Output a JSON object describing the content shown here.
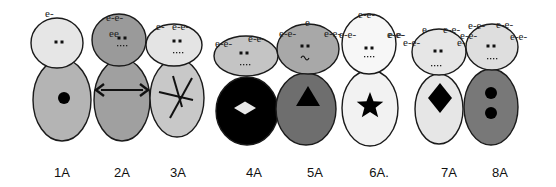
{
  "figures": [
    {
      "label": "1A",
      "label_x": 62,
      "head": {
        "cx": 57,
        "cy": 43,
        "rx": 26,
        "ry": 25,
        "fill": "#e6e6e6"
      },
      "body": {
        "cx": 62,
        "cy": 100,
        "rx": 29,
        "ry": 41,
        "fill": "#b4b4b4"
      },
      "eyes": [
        {
          "x": 56,
          "y": 42
        },
        {
          "x": 62,
          "y": 42
        }
      ],
      "mouth": "",
      "electrons": [
        {
          "text": "e-",
          "x": 45,
          "y": 17
        }
      ],
      "symbol": {
        "type": "dot",
        "cx": 64,
        "cy": 98,
        "r": 6,
        "fill": "#000000"
      }
    },
    {
      "label": "2A",
      "label_x": 122,
      "head": {
        "cx": 119,
        "cy": 40,
        "rx": 27,
        "ry": 26,
        "fill": "#9a9a9a"
      },
      "body": {
        "cx": 122,
        "cy": 100,
        "rx": 28,
        "ry": 41,
        "fill": "#a0a0a0"
      },
      "eyes": [
        {
          "x": 119,
          "y": 38
        },
        {
          "x": 125,
          "y": 38
        }
      ],
      "mouth": "dots",
      "mouth_pos": {
        "x": 117,
        "y": 45
      },
      "electrons": [
        {
          "text": "e-e-",
          "x": 106,
          "y": 21
        },
        {
          "text": "ee",
          "x": 109,
          "y": 37
        }
      ],
      "symbol": {
        "type": "double-arrow",
        "x1": 96,
        "x2": 148,
        "y": 90
      }
    },
    {
      "label": "3A",
      "label_x": 178,
      "head": {
        "cx": 174,
        "cy": 45,
        "rx": 28,
        "ry": 21,
        "fill": "#e4e4e4"
      },
      "body": {
        "cx": 177,
        "cy": 98,
        "rx": 27,
        "ry": 39,
        "fill": "#c8c8c8"
      },
      "eyes": [
        {
          "x": 174,
          "y": 41
        },
        {
          "x": 180,
          "y": 41
        }
      ],
      "mouth": "dots",
      "mouth_pos": {
        "x": 173,
        "y": 52
      },
      "electrons": [
        {
          "text": "e-",
          "x": 156,
          "y": 30
        },
        {
          "text": "e-e-",
          "x": 172,
          "y": 30
        }
      ],
      "symbol": {
        "type": "asterisk",
        "cx": 180,
        "cy": 97
      }
    },
    {
      "label": "4A",
      "label_x": 254,
      "head": {
        "cx": 246,
        "cy": 56,
        "rx": 32,
        "ry": 20,
        "fill": "#c4c4c4"
      },
      "body": {
        "cx": 247,
        "cy": 111,
        "rx": 31,
        "ry": 34,
        "fill": "#000000"
      },
      "eyes": [
        {
          "x": 241,
          "y": 53
        },
        {
          "x": 247,
          "y": 53
        }
      ],
      "mouth": "dots",
      "mouth_pos": {
        "x": 240,
        "y": 64
      },
      "electrons": [
        {
          "text": "e-e-",
          "x": 215,
          "y": 47
        },
        {
          "text": "e-e-",
          "x": 248,
          "y": 42
        }
      ],
      "symbol": {
        "type": "diamond",
        "cx": 245,
        "cy": 108,
        "w": 22,
        "h": 13,
        "fill": "#e8e8e8"
      }
    },
    {
      "label": "5A",
      "label_x": 315,
      "head": {
        "cx": 308,
        "cy": 49,
        "rx": 31,
        "ry": 25,
        "fill": "#a8a8a8"
      },
      "body": {
        "cx": 306,
        "cy": 109,
        "rx": 30,
        "ry": 36,
        "fill": "#6e6e6e"
      },
      "eyes": [
        {
          "x": 302,
          "y": 46
        },
        {
          "x": 308,
          "y": 46
        }
      ],
      "mouth": "tilde",
      "mouth_pos": {
        "x": 305,
        "y": 57
      },
      "electrons": [
        {
          "text": "e",
          "x": 305,
          "y": 26
        },
        {
          "text": "e-e-",
          "x": 279,
          "y": 37
        },
        {
          "text": "e-e-",
          "x": 324,
          "y": 37
        }
      ],
      "symbol": {
        "type": "triangle",
        "cx": 308,
        "cy": 96,
        "w": 24,
        "h": 20,
        "fill": "#000000"
      }
    },
    {
      "label": "6A.",
      "label_x": 379,
      "head": {
        "cx": 369,
        "cy": 44,
        "rx": 27,
        "ry": 30,
        "fill": "#f7f7f7"
      },
      "body": {
        "cx": 370,
        "cy": 108,
        "rx": 28,
        "ry": 38,
        "fill": "#f2f2f2"
      },
      "eyes": [
        {
          "x": 366,
          "y": 48
        },
        {
          "x": 372,
          "y": 48
        }
      ],
      "mouth": "dots",
      "mouth_pos": {
        "x": 364,
        "y": 56
      },
      "electrons": [
        {
          "text": "e-e-",
          "x": 358,
          "y": 18
        },
        {
          "text": "e-e-",
          "x": 339,
          "y": 38
        },
        {
          "text": "e-e-",
          "x": 387,
          "y": 38
        }
      ],
      "symbol": {
        "type": "star",
        "cx": 370,
        "cy": 106,
        "r": 14,
        "fill": "#000000"
      }
    },
    {
      "label": "7A",
      "label_x": 449,
      "head": {
        "cx": 439,
        "cy": 52,
        "rx": 27,
        "ry": 23,
        "fill": "#e6e6e6"
      },
      "body": {
        "cx": 439,
        "cy": 109,
        "rx": 24,
        "ry": 35,
        "fill": "#e6e6e6"
      },
      "eyes": [
        {
          "x": 435,
          "y": 51
        },
        {
          "x": 441,
          "y": 51
        }
      ],
      "mouth": "dots",
      "mouth_pos": {
        "x": 431,
        "y": 65
      },
      "electrons": [
        {
          "text": "e-e-",
          "x": 403,
          "y": 46
        },
        {
          "text": "e",
          "x": 422,
          "y": 33
        },
        {
          "text": "e-e-",
          "x": 443,
          "y": 33
        },
        {
          "text": "e-e-",
          "x": 457,
          "y": 46
        },
        {
          "text": "e-e-",
          "x": 388,
          "y": 38
        }
      ],
      "symbol": {
        "type": "diamond",
        "cx": 440,
        "cy": 98,
        "w": 24,
        "h": 30,
        "fill": "#000000"
      }
    },
    {
      "label": "8A",
      "label_x": 500,
      "head": {
        "cx": 492,
        "cy": 47,
        "rx": 26,
        "ry": 23,
        "fill": "#dedede"
      },
      "body": {
        "cx": 491,
        "cy": 107,
        "rx": 27,
        "ry": 38,
        "fill": "#787878"
      },
      "eyes": [
        {
          "x": 488,
          "y": 46
        },
        {
          "x": 494,
          "y": 46
        }
      ],
      "mouth": "dots",
      "mouth_pos": {
        "x": 487,
        "y": 58
      },
      "electrons": [
        {
          "text": "e-e-",
          "x": 468,
          "y": 29
        },
        {
          "text": "e-e-",
          "x": 496,
          "y": 28
        },
        {
          "text": "e-e-",
          "x": 510,
          "y": 40
        },
        {
          "text": "e-e-",
          "x": 460,
          "y": 39
        }
      ],
      "symbol": {
        "type": "two-dots",
        "cx": 491,
        "cy1": 93,
        "cy2": 113,
        "r": 6,
        "fill": "#000000"
      }
    }
  ]
}
